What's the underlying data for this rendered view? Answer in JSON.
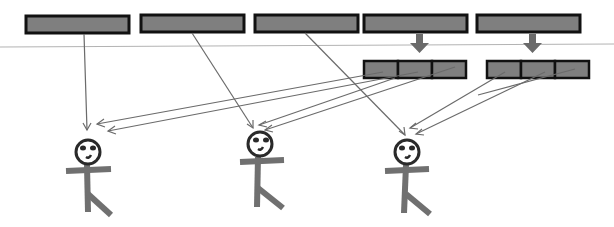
{
  "diagram": {
    "colors": {
      "block_fill": "#7f7f7f",
      "block_border": "#111111",
      "connector": "#6b6b6b",
      "figure_limb": "#707070",
      "divider": "#b3b3b3"
    },
    "top_blocks": [
      {
        "id": "block-1",
        "x": 26,
        "y": 15,
        "w": 103,
        "h": 17
      },
      {
        "id": "block-2",
        "x": 141,
        "y": 15,
        "w": 103,
        "h": 17
      },
      {
        "id": "block-3",
        "x": 255,
        "y": 15,
        "w": 103,
        "h": 17
      },
      {
        "id": "block-4",
        "x": 364,
        "y": 15,
        "w": 103,
        "h": 17,
        "split": true
      },
      {
        "id": "block-5",
        "x": 477,
        "y": 15,
        "w": 103,
        "h": 17,
        "split": true
      }
    ],
    "split_groups": [
      {
        "source": "block-4",
        "x": 364,
        "y": 61,
        "w": 102,
        "h": 17,
        "segments": 3
      },
      {
        "source": "block-5",
        "x": 487,
        "y": 61,
        "w": 102,
        "h": 17,
        "segments": 3
      }
    ],
    "recipients": [
      {
        "id": "person-1",
        "cx": 88,
        "cy": 153
      },
      {
        "id": "person-2",
        "cx": 261,
        "cy": 146
      },
      {
        "id": "person-3",
        "cx": 407,
        "cy": 152
      }
    ]
  }
}
